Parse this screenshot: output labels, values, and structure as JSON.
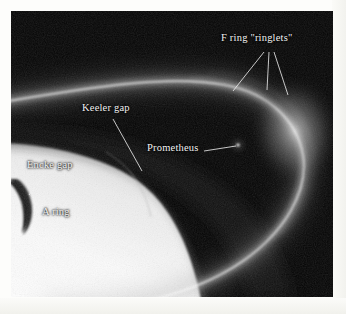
{
  "figure": {
    "background_color": "#050505",
    "label_color": "#f2f2f2",
    "frame": {
      "x": 11,
      "y": 11,
      "width": 322,
      "height": 286
    }
  },
  "annotations": [
    {
      "id": "f-ring-ringlets",
      "label": "F ring \"ringlets\"",
      "x": 221,
      "y": 31,
      "leaders": 3
    },
    {
      "id": "keeler-gap",
      "label": "Keeler gap",
      "x": 82,
      "y": 101,
      "leaders": 1
    },
    {
      "id": "prometheus",
      "label": "Prometheus",
      "x": 147,
      "y": 141,
      "leaders": 1
    },
    {
      "id": "encke-gap",
      "label": "Encke gap",
      "x": 27,
      "y": 158,
      "leaders": 1
    },
    {
      "id": "a-ring",
      "label": "A ring",
      "x": 42,
      "y": 205,
      "leaders": 0
    }
  ],
  "features": {
    "a_ring_name": "A ring",
    "f_ring_name": "F ring",
    "encke_gap_name": "Encke gap",
    "keeler_gap_name": "Keeler gap",
    "prometheus_name": "Prometheus"
  }
}
